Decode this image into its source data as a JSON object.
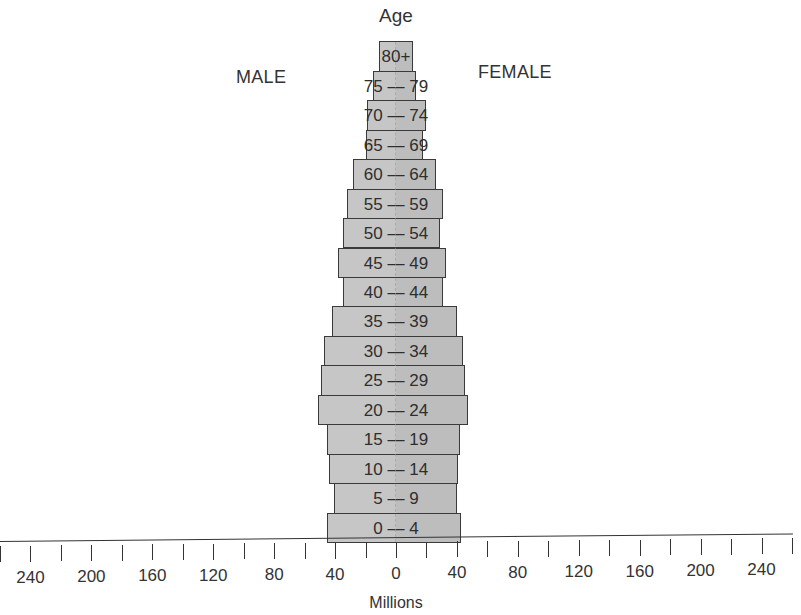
{
  "chart_data": {
    "type": "bar",
    "subtype": "population-pyramid",
    "title": "Age",
    "xlabel": "Millions",
    "ylabel": "Age",
    "left_label": "MALE",
    "right_label": "FEMALE",
    "categories": [
      "0 — 4",
      "5 — 9",
      "10 — 14",
      "15 — 19",
      "20 — 24",
      "25 — 29",
      "30 — 34",
      "35 — 39",
      "40 — 44",
      "45 — 49",
      "50 — 54",
      "55 — 59",
      "60 — 64",
      "65 — 69",
      "70 — 74",
      "75 — 79",
      "80+"
    ],
    "series": [
      {
        "name": "MALE",
        "values": [
          45,
          41,
          44,
          45,
          51,
          49,
          47,
          42,
          35,
          38,
          35,
          32,
          28,
          20,
          19,
          15,
          11
        ]
      },
      {
        "name": "FEMALE",
        "values": [
          43,
          40,
          41,
          42,
          47,
          45,
          44,
          40,
          31,
          33,
          29,
          31,
          26,
          18,
          20,
          13,
          11
        ]
      }
    ],
    "x_ticks_left": [
      240,
      200,
      160,
      120,
      80,
      40
    ],
    "x_ticks_center": [
      0
    ],
    "x_ticks_right": [
      40,
      80,
      120,
      160,
      200,
      240
    ],
    "xlim": [
      -260,
      260
    ],
    "tick_interval": 20,
    "label_interval": 40,
    "grid": false,
    "legend": "none",
    "colors": {
      "bar_fill": "#c6c6c6",
      "bar_border": "#3a3a3a",
      "text": "#333333"
    }
  },
  "labels": {
    "title": "Age",
    "male": "MALE",
    "female": "FEMALE",
    "axis_title": "Millions"
  }
}
